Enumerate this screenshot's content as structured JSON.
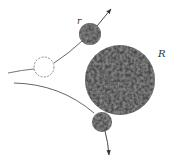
{
  "diagram": {
    "title": "",
    "labels": {
      "small_sphere": "r",
      "large_sphere": "R"
    },
    "colors": {
      "sphere_fill": "#4a4a4a",
      "sphere_light": "#7a7a7a",
      "sphere_dark": "#2e2e2e",
      "trajectory": "#555555",
      "ghost_circle": "#777777",
      "background": "#ffffff"
    },
    "elements": [
      {
        "name": "large-sphere",
        "label": "R",
        "cx": 120,
        "cy": 80,
        "r": 35
      },
      {
        "name": "small-sphere-contact",
        "label": "r",
        "cx": 90,
        "cy": 34,
        "r": 11
      },
      {
        "name": "ghost-sphere",
        "cx": 44,
        "cy": 67,
        "r": 10,
        "style": "dashed-outline"
      },
      {
        "name": "small-sphere-deflected",
        "cx": 102,
        "cy": 122,
        "r": 10
      }
    ]
  }
}
